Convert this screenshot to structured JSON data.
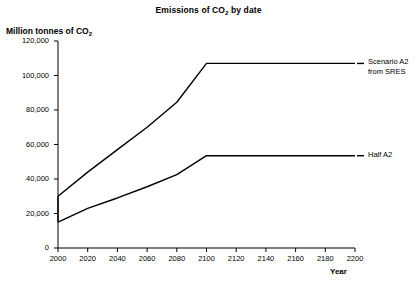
{
  "chart_data": {
    "type": "line",
    "title": "Emissions of CO2 by date",
    "title_prefix": "Emissions of CO",
    "title_sub": "2",
    "title_suffix": " by date",
    "xlabel": "Year",
    "ylabel": "Million tonnes of CO2",
    "ylabel_prefix": "Million tonnes of CO",
    "ylabel_sub": "2",
    "xlim": [
      2000,
      2200
    ],
    "ylim": [
      0,
      120000
    ],
    "grid": false,
    "legend_position": "right-inline",
    "xticks": [
      2000,
      2020,
      2040,
      2060,
      2080,
      2100,
      2120,
      2140,
      2160,
      2180,
      2200
    ],
    "xtick_labels": [
      "2000",
      "2020",
      "2040",
      "2060",
      "2080",
      "2100",
      "2120",
      "2140",
      "2160",
      "2180",
      "2200"
    ],
    "yticks": [
      0,
      20000,
      40000,
      60000,
      80000,
      100000,
      120000
    ],
    "ytick_labels": [
      "0",
      "20,000",
      "40,000",
      "60,000",
      "80,000",
      "100,000",
      "120,000"
    ],
    "series": [
      {
        "name": "Scenario A2 from SRES",
        "label_line1": "Scenario A2",
        "label_line2": "from SRES",
        "color": "#000000",
        "x": [
          2000,
          2020,
          2040,
          2060,
          2080,
          2100,
          2120,
          2140,
          2160,
          2180,
          2200
        ],
        "values": [
          30000,
          44000,
          57000,
          70000,
          84500,
          107000,
          107000,
          107000,
          107000,
          107000,
          107000
        ]
      },
      {
        "name": "Half A2",
        "label_line1": "Half A2",
        "label_line2": "",
        "color": "#000000",
        "x": [
          2000,
          2020,
          2040,
          2060,
          2080,
          2100,
          2120,
          2140,
          2160,
          2180,
          2200
        ],
        "values": [
          15000,
          23000,
          29000,
          35500,
          42500,
          53500,
          53500,
          53500,
          53500,
          53500,
          53500
        ]
      }
    ],
    "annotations": [
      {
        "name": "vertical-jump-at-2000",
        "x": 2000,
        "y_from": 15000,
        "y_to": 30000
      }
    ]
  }
}
